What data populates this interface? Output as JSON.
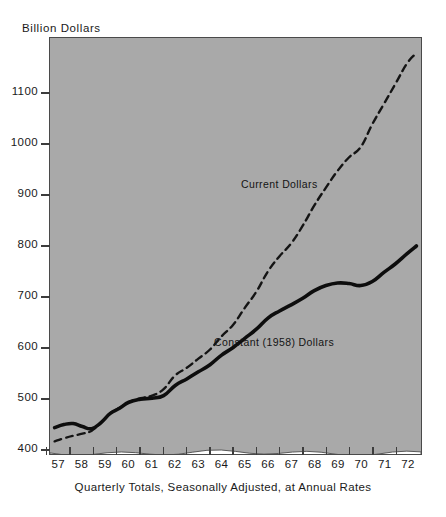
{
  "chart": {
    "y_axis_title": "Billion Dollars",
    "caption": "Quarterly Totals, Seasonally Adjusted, at Annual Rates",
    "background_color": "#a9a9a9",
    "frame_color": "#4a4a4a",
    "axis_break_note": "wavy white band below 400 indicating a broken y-axis"
  },
  "labels": {
    "current": "Current Dollars",
    "constant": "Constant (1958) Dollars"
  },
  "chart_data": {
    "type": "line",
    "title": "Billion Dollars",
    "xlabel": "Quarterly Totals, Seasonally Adjusted, at Annual Rates",
    "ylabel": "Billion Dollars",
    "xlim": [
      1956.6,
      1972.6
    ],
    "ylim": [
      390,
      1210
    ],
    "ytick_values": [
      400,
      500,
      600,
      700,
      800,
      900,
      1000,
      1100
    ],
    "ytick_labels": [
      "400",
      "500",
      "600",
      "700",
      "800",
      "900",
      "1000",
      "1100"
    ],
    "xtick_labels": [
      "57",
      "58",
      "59",
      "60",
      "61",
      "62",
      "63",
      "64",
      "65",
      "66",
      "67",
      "68",
      "69",
      "70",
      "71",
      "72"
    ],
    "xtick_values": [
      1957,
      1958,
      1959,
      1960,
      1961,
      1962,
      1963,
      1964,
      1965,
      1966,
      1967,
      1968,
      1969,
      1970,
      1971,
      1972
    ],
    "grid": false,
    "legend": "inline-annotations",
    "series": [
      {
        "name": "Current Dollars",
        "style": "dashed",
        "color": "#141414",
        "x": [
          1956.8,
          1957.2,
          1957.6,
          1958.0,
          1958.4,
          1958.8,
          1959.2,
          1959.6,
          1960.0,
          1960.5,
          1961.0,
          1961.5,
          1962.0,
          1962.5,
          1963.0,
          1963.5,
          1964.0,
          1964.5,
          1965.0,
          1965.5,
          1966.0,
          1966.5,
          1967.0,
          1967.5,
          1968.0,
          1968.5,
          1969.0,
          1969.5,
          1970.0,
          1970.5,
          1971.0,
          1971.5,
          1972.0,
          1972.4
        ],
        "y": [
          415,
          421,
          426,
          430,
          436,
          452,
          470,
          481,
          492,
          500,
          505,
          518,
          545,
          560,
          578,
          596,
          622,
          645,
          678,
          710,
          750,
          780,
          805,
          840,
          880,
          915,
          948,
          975,
          995,
          1040,
          1080,
          1120,
          1160,
          1180
        ]
      },
      {
        "name": "Constant (1958) Dollars",
        "style": "solid",
        "color": "#0d0d0d",
        "x": [
          1956.8,
          1957.2,
          1957.6,
          1958.0,
          1958.4,
          1958.8,
          1959.2,
          1959.6,
          1960.0,
          1960.5,
          1961.0,
          1961.5,
          1962.0,
          1962.5,
          1963.0,
          1963.5,
          1964.0,
          1964.5,
          1965.0,
          1965.5,
          1966.0,
          1966.5,
          1967.0,
          1967.5,
          1968.0,
          1968.5,
          1969.0,
          1969.5,
          1970.0,
          1970.5,
          1971.0,
          1971.5,
          1972.0,
          1972.4
        ],
        "y": [
          442,
          448,
          450,
          444,
          440,
          452,
          470,
          480,
          492,
          498,
          500,
          505,
          525,
          538,
          552,
          566,
          585,
          600,
          618,
          636,
          658,
          672,
          684,
          697,
          712,
          722,
          727,
          726,
          722,
          730,
          748,
          765,
          785,
          800
        ]
      }
    ]
  }
}
